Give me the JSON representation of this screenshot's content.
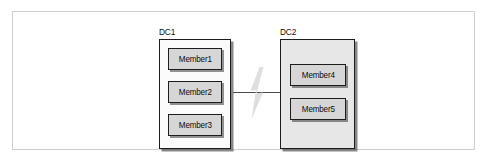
{
  "diagram": {
    "frame": {
      "name": "outer-frame"
    },
    "datacenters": [
      {
        "id": "dc1",
        "label": "DC1",
        "fill": "#fbfbfb",
        "members": [
          {
            "label": "Member1"
          },
          {
            "label": "Member2"
          },
          {
            "label": "Member3"
          }
        ]
      },
      {
        "id": "dc2",
        "label": "DC2",
        "fill": "#e7e7e7",
        "members": [
          {
            "label": "Member4"
          },
          {
            "label": "Member5"
          }
        ]
      }
    ],
    "link": {
      "name": "network-link",
      "icon": "lightning-bolt-icon",
      "icon_color": "#dcdcdc",
      "line_color": "#4a4a4a"
    },
    "colors": {
      "frame_border": "#cfcfcf",
      "box_border": "#1d1d1d",
      "member_fill": "#d6d6d6",
      "shadow": "#282828"
    }
  }
}
